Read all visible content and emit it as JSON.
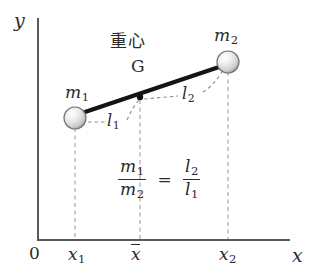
{
  "figure": {
    "type": "physics-diagram",
    "axes": {
      "y_label": "y",
      "x_label": "x",
      "origin_label": "0",
      "x_ticks": [
        "x",
        "x",
        "x"
      ]
    },
    "labels": {
      "origin": "0",
      "y_axis": "y",
      "x_axis": "x",
      "x1_base": "x",
      "x1_sub": "1",
      "xbar_base": "x",
      "x2_base": "x",
      "x2_sub": "2",
      "m1_base": "m",
      "m1_sub": "1",
      "m2_base": "m",
      "m2_sub": "2",
      "l1_base": "l",
      "l1_sub": "1",
      "l2_base": "l",
      "l2_sub": "2",
      "center_of_gravity_jp": "重心",
      "center_of_gravity_point": "G"
    },
    "formula": {
      "numerator_left_base": "m",
      "numerator_left_sub": "1",
      "denominator_left_base": "m",
      "denominator_left_sub": "2",
      "equals": "=",
      "numerator_right_base": "l",
      "numerator_right_sub": "2",
      "denominator_right_base": "l",
      "denominator_right_sub": "1"
    },
    "colors": {
      "ink": "#2b2b2b",
      "axis": "#555555",
      "rod": "#111111",
      "dashed_guide": "#a9a9a9",
      "ball_light": "#fdfdfd",
      "ball_mid": "#e2e2e2",
      "ball_dark": "#9a9a9a",
      "ball_outline": "#6f6f6f"
    },
    "geometry": {
      "axis_origin": [
        38,
        240
      ],
      "axis_x_end": [
        290,
        240
      ],
      "axis_y_top": [
        38,
        18
      ],
      "ball_m1_center": [
        75,
        118
      ],
      "ball_m1_radius": 11,
      "ball_m2_center": [
        228,
        62
      ],
      "ball_m2_radius": 11,
      "point_g": [
        140,
        97
      ],
      "tick_x1": 75,
      "tick_xbar": 140,
      "tick_x2": 228
    }
  }
}
